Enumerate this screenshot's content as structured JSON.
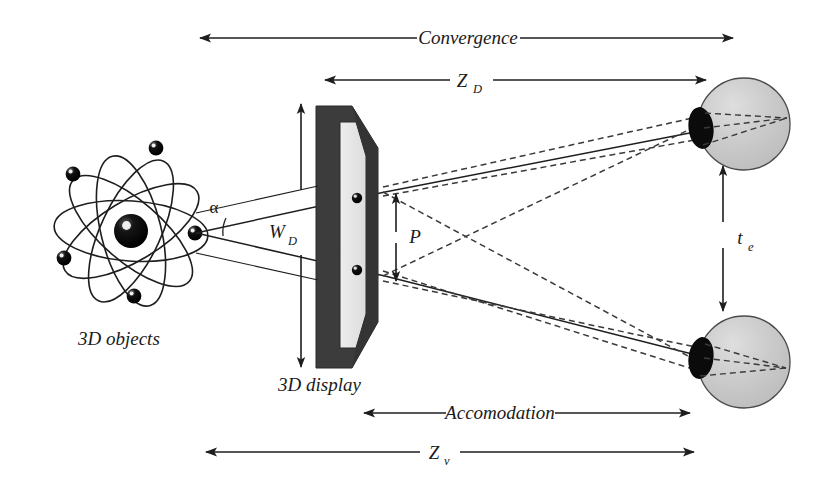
{
  "figure": {
    "background_color": "#ffffff",
    "ink_color": "#1e1e1e"
  },
  "labels": {
    "convergence": "Convergence",
    "z_d_main": "Z",
    "z_d_sub": "D",
    "accommodation": "Accomodation",
    "z_v_main": "Z",
    "z_v_sub": "v",
    "objects_caption": "3D objects",
    "display_caption": "3D display",
    "w_d_main": "W",
    "w_d_sub": "D",
    "p": "P",
    "t_e_main": "t",
    "t_e_sub": "e",
    "alpha": "α"
  },
  "measures": [
    {
      "id": "convergence",
      "label": "Convergence",
      "style": "double-headed-horizontal",
      "from": "3D objects",
      "to": "eyes"
    },
    {
      "id": "z_d",
      "label": "ZD",
      "style": "double-headed-horizontal",
      "from": "3D display",
      "to": "eyes"
    },
    {
      "id": "accommodation",
      "label": "Accomodation",
      "style": "double-headed-horizontal",
      "from": "3D display",
      "to": "eyes"
    },
    {
      "id": "z_v",
      "label": "Zv",
      "style": "double-headed-horizontal",
      "from": "3D objects",
      "to": "eyes"
    },
    {
      "id": "w_d",
      "label": "WD",
      "style": "double-headed-vertical",
      "of": "3D display width"
    },
    {
      "id": "p",
      "label": "P",
      "style": "double-headed-vertical",
      "of": "parallax on screen"
    },
    {
      "id": "t_e",
      "label": "te",
      "style": "double-headed-vertical",
      "of": "interocular distance"
    },
    {
      "id": "alpha",
      "label": "α",
      "style": "angle-arc",
      "of": "convergence angle at object"
    }
  ],
  "components": {
    "atom": {
      "name": "3D objects",
      "nucleus_color": "#0d0d0d",
      "electron_color": "#0d0d0d",
      "orbit_color": "#1e1e1e",
      "electron_count": 6,
      "orbit_count": 5
    },
    "display": {
      "name": "3D display",
      "frame_color": "#3c3c3c",
      "screen_color": "#e6e6e6",
      "pixel_count": 2
    },
    "eyes": [
      {
        "name": "upper-eye",
        "sclera_color": "#c9c9c9",
        "cornea_color": "#0d0d0d",
        "outline_color": "#4a4a4a"
      },
      {
        "name": "lower-eye",
        "sclera_color": "#c9c9c9",
        "cornea_color": "#0d0d0d",
        "outline_color": "#4a4a4a"
      }
    ],
    "rays": {
      "solid_color": "#1e1e1e",
      "dashed_color": "#3a3a3a",
      "dash_pattern": "6 4"
    }
  }
}
